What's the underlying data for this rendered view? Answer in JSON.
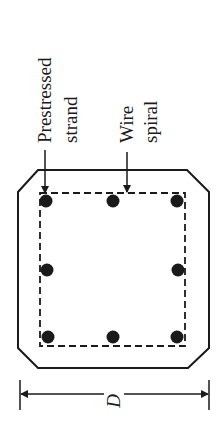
{
  "diagram": {
    "labels": {
      "strand": [
        "Prestressed",
        "strand"
      ],
      "spiral": [
        "Wire",
        "spiral"
      ],
      "dimension": "D"
    },
    "colors": {
      "line": "#1a1a1a",
      "background": "#ffffff"
    },
    "strands": [
      {
        "x": 46,
        "y": 200
      },
      {
        "x": 113,
        "y": 200
      },
      {
        "x": 176,
        "y": 200
      },
      {
        "x": 47,
        "y": 270
      },
      {
        "x": 177,
        "y": 270
      },
      {
        "x": 48,
        "y": 337
      },
      {
        "x": 113,
        "y": 337
      },
      {
        "x": 177,
        "y": 337
      }
    ]
  }
}
